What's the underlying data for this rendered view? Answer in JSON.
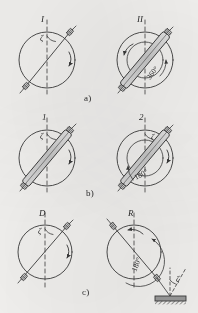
{
  "figure": {
    "ink_color": "#3a3a3a",
    "fill_color": "#cfcfcf",
    "background_color": "#f3f2f0",
    "row_captions": [
      {
        "id": "a",
        "label": "a)"
      },
      {
        "id": "b",
        "label": "b)"
      },
      {
        "id": "c",
        "label": "c)"
      }
    ],
    "panels": [
      {
        "id": "a-left",
        "row": "a",
        "side": "left",
        "top_label": "I",
        "angle_symbol": "ζ",
        "angle_text": "",
        "has_inner_arc": false,
        "probe_style": "line",
        "rotation_arrow": "clockwise",
        "has_detector_plate": false
      },
      {
        "id": "a-right",
        "row": "a",
        "side": "right",
        "top_label": "II",
        "angle_symbol": "",
        "angle_text": "360°",
        "has_inner_arc": true,
        "probe_style": "bar",
        "rotation_arrow": "counterclockwise",
        "has_detector_plate": false
      },
      {
        "id": "b-left",
        "row": "b",
        "side": "left",
        "top_label": "1",
        "angle_symbol": "ζ",
        "angle_text": "",
        "has_inner_arc": false,
        "probe_style": "bar",
        "rotation_arrow": "clockwise",
        "has_detector_plate": false
      },
      {
        "id": "b-right",
        "row": "b",
        "side": "right",
        "top_label": "2",
        "angle_symbol": "ζ",
        "angle_text": "180°",
        "has_inner_arc": true,
        "probe_style": "bar",
        "rotation_arrow": "clockwise",
        "has_detector_plate": false
      },
      {
        "id": "c-left",
        "row": "c",
        "side": "left",
        "top_label": "D",
        "angle_symbol": "ζ",
        "angle_text": "",
        "has_inner_arc": false,
        "probe_style": "line",
        "rotation_arrow": "clockwise",
        "has_detector_plate": false
      },
      {
        "id": "c-right",
        "row": "c",
        "side": "right",
        "top_label": "R",
        "angle_symbol": "ζ",
        "angle_text": "180°",
        "has_inner_arc": true,
        "probe_style": "line",
        "rotation_arrow": "counterclockwise",
        "has_detector_plate": true
      }
    ]
  }
}
